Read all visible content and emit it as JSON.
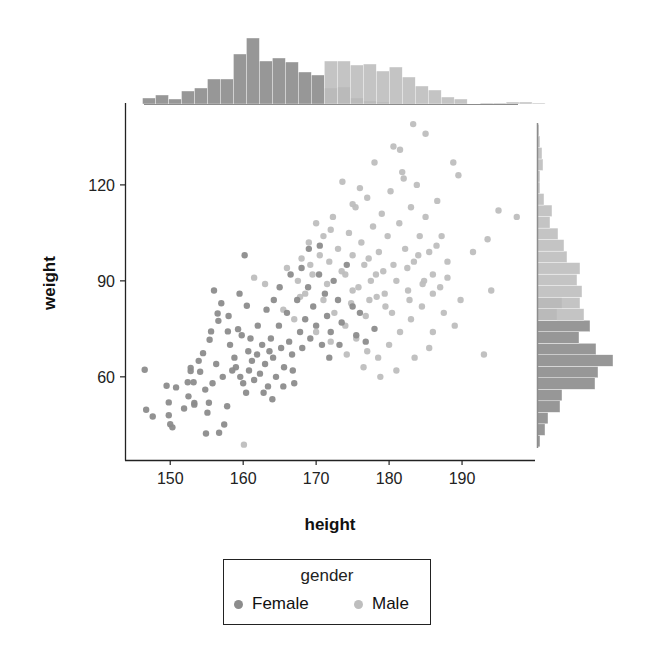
{
  "chart_data": {
    "type": "scatter",
    "title": "",
    "xlabel": "height",
    "ylabel": "weight",
    "xlim": [
      143.8,
      200
    ],
    "ylim": [
      34,
      145.6
    ],
    "xticks": [
      150,
      160,
      170,
      180,
      190
    ],
    "yticks": [
      60,
      90,
      120
    ],
    "grid": false,
    "legend": {
      "title": "gender",
      "placement": "bottom-center",
      "entries": [
        {
          "label": "Female",
          "color": "#8c8c8c"
        },
        {
          "label": "Male",
          "color": "#bebebe"
        }
      ]
    },
    "series": [
      {
        "name": "Female",
        "color": "#8c8c8c",
        "points": [
          [
            146.5,
            62.2
          ],
          [
            146.7,
            49.7
          ],
          [
            147.6,
            47.6
          ],
          [
            149.5,
            57.2
          ],
          [
            150.8,
            56.7
          ],
          [
            149.8,
            52
          ],
          [
            149.8,
            48
          ],
          [
            150,
            45.2
          ],
          [
            150.3,
            44.2
          ],
          [
            151.9,
            50.1
          ],
          [
            152.4,
            58.3
          ],
          [
            152.5,
            53.9
          ],
          [
            152.8,
            62.8
          ],
          [
            152.8,
            61.8
          ],
          [
            153.2,
            58.3
          ],
          [
            153.3,
            51.8
          ],
          [
            153.3,
            51.3
          ],
          [
            154.1,
            61.6
          ],
          [
            154.5,
            67.4
          ],
          [
            154.9,
            42.3
          ],
          [
            155.1,
            48.8
          ],
          [
            155.3,
            51.9
          ],
          [
            155.4,
            71.6
          ],
          [
            155.6,
            74.2
          ],
          [
            156.5,
            79.8
          ],
          [
            156.6,
            77.5
          ],
          [
            156.7,
            42.5
          ],
          [
            157.4,
            45.1
          ],
          [
            157.8,
            50.8
          ],
          [
            157.9,
            74.2
          ],
          [
            159.3,
            74.9
          ],
          [
            160.5,
            82.2
          ],
          [
            160.2,
            98
          ],
          [
            159.5,
            86
          ],
          [
            158.2,
            70
          ],
          [
            158.8,
            66
          ],
          [
            159.0,
            63
          ],
          [
            159.6,
            60
          ],
          [
            160,
            58
          ],
          [
            160.4,
            55
          ],
          [
            160.8,
            62
          ],
          [
            161.2,
            65
          ],
          [
            161.5,
            59
          ],
          [
            161.9,
            67
          ],
          [
            162.3,
            61
          ],
          [
            162.6,
            70
          ],
          [
            163,
            64
          ],
          [
            163.4,
            57
          ],
          [
            163.8,
            72
          ],
          [
            164.1,
            66
          ],
          [
            164.5,
            60
          ],
          [
            164.9,
            76
          ],
          [
            165.2,
            69
          ],
          [
            165.6,
            63
          ],
          [
            166,
            80
          ],
          [
            166.3,
            71
          ],
          [
            166.7,
            67
          ],
          [
            167,
            58
          ],
          [
            167.4,
            84
          ],
          [
            167.8,
            74
          ],
          [
            168.1,
            69
          ],
          [
            168.5,
            78
          ],
          [
            168.9,
            88
          ],
          [
            169.2,
            72
          ],
          [
            169.6,
            82
          ],
          [
            170,
            76
          ],
          [
            170.4,
            92
          ],
          [
            170.8,
            70
          ],
          [
            171.2,
            86
          ],
          [
            171.5,
            79
          ],
          [
            172,
            74
          ],
          [
            172.4,
            90
          ],
          [
            173,
            84
          ],
          [
            173.5,
            77
          ],
          [
            174.2,
            95
          ],
          [
            175,
            82
          ],
          [
            176,
            80
          ],
          [
            176.8,
            71
          ],
          [
            158.5,
            62
          ],
          [
            157.2,
            60
          ],
          [
            156.3,
            64
          ],
          [
            155.8,
            58
          ],
          [
            154.8,
            56
          ],
          [
            153.9,
            65
          ],
          [
            161,
            72
          ],
          [
            162,
            76
          ],
          [
            163.2,
            81
          ],
          [
            164.2,
            84
          ],
          [
            165,
            88
          ],
          [
            166.5,
            92
          ],
          [
            168,
            94
          ],
          [
            169,
            100
          ],
          [
            170.5,
            101
          ],
          [
            160.7,
            68
          ],
          [
            159.8,
            73
          ],
          [
            158,
            79
          ],
          [
            157,
            83
          ],
          [
            156,
            87
          ],
          [
            162.8,
            55
          ],
          [
            164,
            53
          ],
          [
            165.5,
            57
          ],
          [
            166.8,
            62
          ],
          [
            163.6,
            68
          ],
          [
            171.8,
            66
          ],
          [
            173.2,
            70
          ],
          [
            175.5,
            73
          ],
          [
            178,
            75
          ]
        ]
      },
      {
        "name": "Male",
        "color": "#bebebe",
        "points": [
          [
            160.1,
            38.8
          ],
          [
            161.5,
            91
          ],
          [
            166,
            94
          ],
          [
            167.5,
            90
          ],
          [
            168,
            97
          ],
          [
            169,
            102
          ],
          [
            170,
            108
          ],
          [
            171,
            104
          ],
          [
            171.8,
            96
          ],
          [
            172.3,
            110
          ],
          [
            173,
            100
          ],
          [
            173.6,
            121
          ],
          [
            174,
            92
          ],
          [
            174.5,
            105
          ],
          [
            175,
            98
          ],
          [
            175.4,
            113
          ],
          [
            175.8,
            88
          ],
          [
            176.2,
            102
          ],
          [
            176.6,
            95
          ],
          [
            177,
            116
          ],
          [
            177.3,
            84
          ],
          [
            177.8,
            107
          ],
          [
            178.2,
            92
          ],
          [
            178.6,
            99
          ],
          [
            179,
            111
          ],
          [
            179.4,
            86
          ],
          [
            179.8,
            104
          ],
          [
            180.2,
            118
          ],
          [
            180.6,
            95
          ],
          [
            181,
            90
          ],
          [
            181.4,
            108
          ],
          [
            181.8,
            124
          ],
          [
            182.2,
            100
          ],
          [
            182.6,
            87
          ],
          [
            183,
            113
          ],
          [
            183.4,
            96
          ],
          [
            183.8,
            120
          ],
          [
            184.2,
            104
          ],
          [
            184.6,
            89
          ],
          [
            185,
            110
          ],
          [
            185.5,
            99
          ],
          [
            186,
            92
          ],
          [
            186.6,
            115
          ],
          [
            187.2,
            104
          ],
          [
            188,
            96
          ],
          [
            188.8,
            127
          ],
          [
            189.5,
            123
          ],
          [
            191.5,
            99
          ],
          [
            193.5,
            103
          ],
          [
            195,
            112
          ],
          [
            197.5,
            110
          ],
          [
            194,
            87
          ],
          [
            193,
            67
          ],
          [
            183.3,
            139
          ],
          [
            181.5,
            131
          ],
          [
            185,
            136
          ],
          [
            178,
            127
          ],
          [
            180.6,
            132
          ],
          [
            182,
            122
          ],
          [
            176,
            119
          ],
          [
            175,
            114
          ],
          [
            172,
            106
          ],
          [
            170.5,
            98
          ],
          [
            169.5,
            92
          ],
          [
            168.5,
            86
          ],
          [
            171,
            84
          ],
          [
            172.5,
            80
          ],
          [
            174,
            76
          ],
          [
            175.5,
            72
          ],
          [
            177,
            68
          ],
          [
            178.5,
            66
          ],
          [
            180,
            70
          ],
          [
            181.5,
            74
          ],
          [
            183,
            78
          ],
          [
            184.5,
            82
          ],
          [
            186,
            86
          ],
          [
            187.5,
            80
          ],
          [
            189,
            76
          ],
          [
            185.5,
            69
          ],
          [
            183.5,
            66
          ],
          [
            181,
            62
          ],
          [
            178.8,
            60
          ],
          [
            176.5,
            63
          ],
          [
            174.2,
            67
          ],
          [
            172,
            71
          ],
          [
            170,
            74
          ],
          [
            167,
            78
          ],
          [
            165.5,
            81
          ],
          [
            163,
            89
          ],
          [
            177.5,
            90
          ],
          [
            179.5,
            82
          ],
          [
            182.5,
            94
          ],
          [
            184,
            98
          ],
          [
            186.5,
            101
          ],
          [
            175,
            87
          ],
          [
            173.5,
            93
          ],
          [
            176.8,
            79
          ],
          [
            178.3,
            85
          ],
          [
            180.4,
            80
          ],
          [
            182.8,
            84
          ],
          [
            184.8,
            90
          ],
          [
            188,
            91
          ],
          [
            187,
            88
          ],
          [
            189.8,
            84
          ],
          [
            186,
            74
          ],
          [
            171.5,
            89
          ],
          [
            169.2,
            95
          ],
          [
            167.8,
            85
          ],
          [
            174.8,
            83
          ],
          [
            177.2,
            97
          ],
          [
            179.2,
            93
          ]
        ]
      }
    ],
    "marginal_x_histogram": {
      "bin_start": 146.2,
      "bin_width": 1.78,
      "female_counts": [
        6,
        9,
        5,
        13,
        16,
        25,
        25,
        50,
        66,
        43,
        46,
        42,
        32,
        29,
        16,
        17,
        6,
        3,
        2,
        1,
        1,
        0,
        0,
        0,
        0,
        0,
        0,
        0,
        0,
        0,
        0
      ],
      "male_counts": [
        0,
        0,
        0,
        0,
        0,
        0,
        0,
        0,
        0,
        0,
        0,
        0,
        0,
        0,
        43,
        43,
        39,
        40,
        33,
        37,
        27,
        18,
        14,
        7,
        5,
        0,
        1,
        1,
        2,
        2,
        1
      ]
    },
    "marginal_y_histogram": {
      "bin_start": 38.1,
      "bin_width": 3.6,
      "female_counts": [
        3,
        8,
        11,
        23,
        25,
        58,
        61,
        76,
        59,
        42,
        53,
        20,
        25,
        0,
        0,
        0,
        0,
        0,
        0,
        0,
        0,
        0,
        0,
        0,
        0,
        0,
        0,
        0
      ],
      "male_counts": [
        0,
        0,
        0,
        0,
        0,
        0,
        0,
        0,
        0,
        0,
        0,
        47,
        43,
        45,
        40,
        43,
        30,
        27,
        21,
        13,
        15,
        7,
        3,
        3,
        6,
        5,
        3,
        2
      ]
    }
  }
}
